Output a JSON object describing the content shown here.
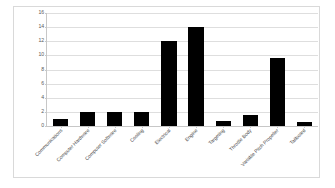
{
  "chart_data": {
    "type": "bar",
    "title": "",
    "subtitle": "",
    "xlabel": "",
    "ylabel": "",
    "ylim": [
      0,
      16
    ],
    "ytick_step": 2,
    "yticks": [
      "16",
      "14",
      "12",
      "10",
      "8",
      "6",
      "4",
      "2",
      "0"
    ],
    "grid": true,
    "legend": false,
    "legend_position": "none",
    "bar_color": "#000000",
    "gridline_color": "#dedede",
    "axis_color": "#c7c7c7",
    "frame_color": "#d9d9d9",
    "label_rotation_degrees": -45,
    "categories": [
      "Communications",
      "Computer Hardware",
      "Computer Software",
      "Cooling",
      "Electrical",
      "Engine",
      "Targeting",
      "Throttle Body",
      "Variable Pitch Propeller",
      "Tailboard"
    ],
    "values": [
      1,
      2,
      2,
      2,
      12,
      14,
      0.7,
      1.6,
      9.7,
      0.6
    ]
  }
}
